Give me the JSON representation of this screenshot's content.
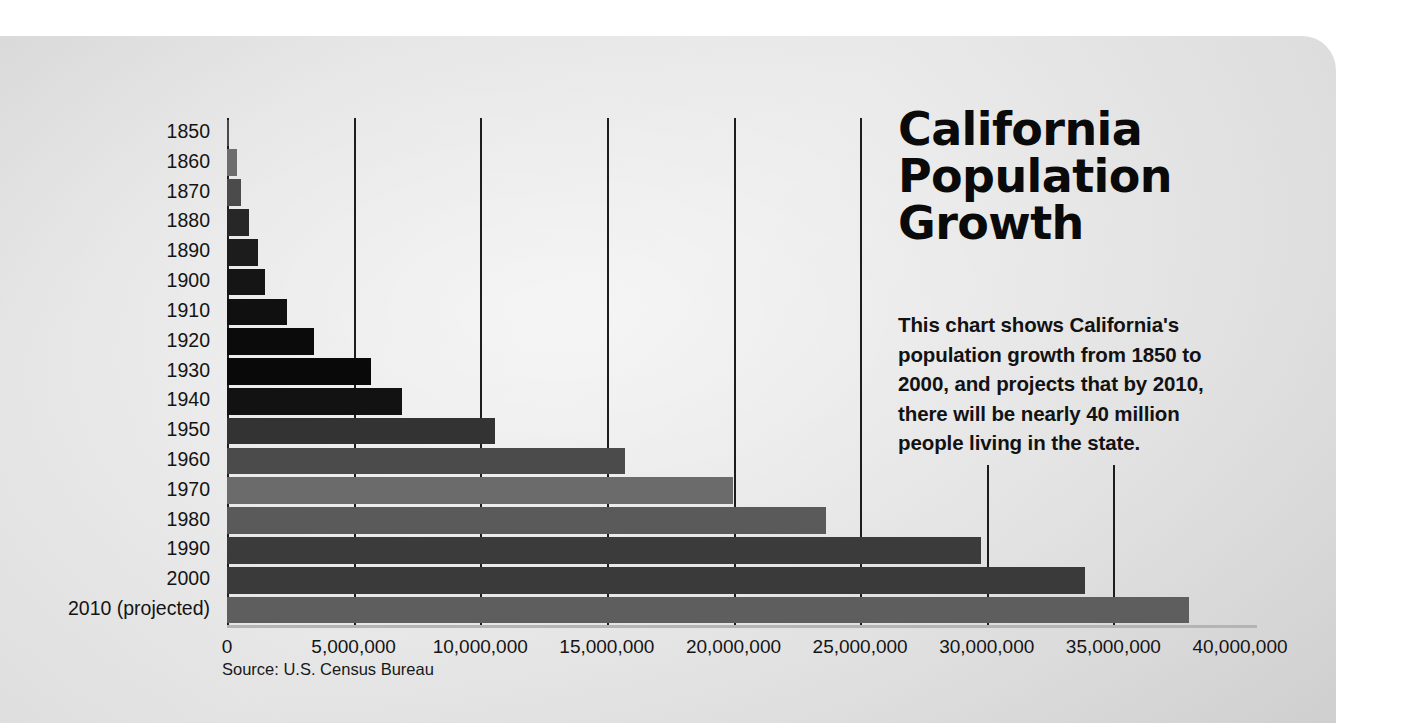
{
  "title_lines": [
    "California",
    "Population",
    "Growth"
  ],
  "blurb_lines": [
    "This chart shows California's",
    "population growth from 1850 to",
    "2000, and projects that by 2010,",
    "there will be nearly 40 million",
    "people living in the state."
  ],
  "source": "Source: U.S. Census Bureau",
  "chart_data": {
    "type": "bar",
    "orientation": "horizontal",
    "xlabel": "",
    "ylabel": "",
    "xlim": [
      0,
      40000000
    ],
    "xticks": [
      0,
      5000000,
      10000000,
      15000000,
      20000000,
      25000000,
      30000000,
      35000000,
      40000000
    ],
    "xtick_labels": [
      "0",
      "5,000,000",
      "10,000,000",
      "15,000,000",
      "20,000,000",
      "25,000,000",
      "30,000,000",
      "35,000,000",
      "40,000,000"
    ],
    "grid": "vertical",
    "legend": "none",
    "categories": [
      "1850",
      "1860",
      "1870",
      "1880",
      "1890",
      "1900",
      "1910",
      "1920",
      "1930",
      "1940",
      "1950",
      "1960",
      "1970",
      "1980",
      "1990",
      "2000",
      "2010 (projected)"
    ],
    "values": [
      92597,
      380000,
      560000,
      865000,
      1213000,
      1485000,
      2378000,
      3427000,
      5677000,
      6907000,
      10586000,
      15717000,
      19971000,
      23668000,
      29760000,
      33872000,
      38000000
    ],
    "bar_colors": [
      "#4a4a4a",
      "#6d6d6d",
      "#4b4b4b",
      "#272727",
      "#1c1c1c",
      "#151515",
      "#101010",
      "#0b0b0b",
      "#090909",
      "#121212",
      "#333333",
      "#4b4b4b",
      "#6b6b6b",
      "#5a5a5a",
      "#3b3b3b",
      "#3a3a3a",
      "#5e5e5e"
    ],
    "axis_color": "#1d1d1d",
    "background": "#e6e6e6",
    "note": "Values read from bar ends against 5,000,000-step vertical gridlines."
  }
}
